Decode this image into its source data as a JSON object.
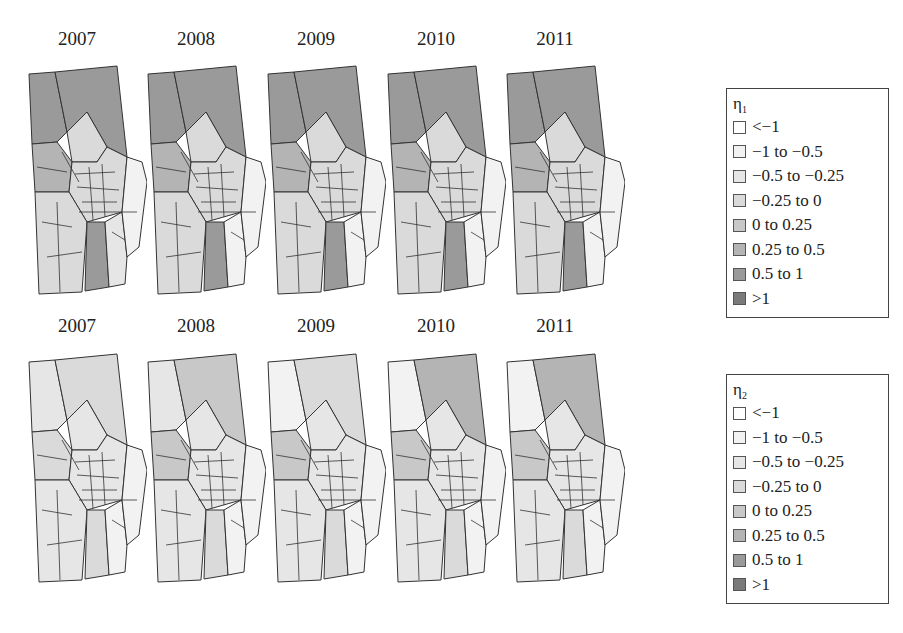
{
  "chart_data": [
    {
      "type": "heatmap",
      "subtype": "choropleth-map-small-multiples",
      "title": "",
      "row_label": "η1",
      "panels": [
        "2007",
        "2008",
        "2009",
        "2010",
        "2011"
      ],
      "legend": {
        "title": "η1",
        "bins": [
          "<−1",
          "−1 to −0.5",
          "−0.5 to −0.25",
          "−0.25 to 0",
          "0 to 0.25",
          "0.25 to 0.5",
          "0.5 to 1",
          ">1"
        ]
      },
      "dominant_pattern": "Northern large districts and southern-central strip shaded 0.5 to 1; central core mixed 0 to 0.5; outer western/southern districts near −0.25 to 0"
    },
    {
      "type": "heatmap",
      "subtype": "choropleth-map-small-multiples",
      "title": "",
      "row_label": "η2",
      "panels": [
        "2007",
        "2008",
        "2009",
        "2010",
        "2011"
      ],
      "legend": {
        "title": "η2",
        "bins": [
          "<−1",
          "−1 to −0.5",
          "−0.5 to −0.25",
          "−0.25 to 0",
          "0 to 0.25",
          "0.25 to 0.5",
          "0.5 to 1",
          ">1"
        ]
      },
      "dominant_pattern": "Mostly light (−0.5 to 0.25); northern district darkens over time reaching 0.25 to 0.5 by 2010–2011; scattered central districts 0.25 to 1"
    }
  ],
  "top_row": {
    "years": [
      "2007",
      "2008",
      "2009",
      "2010",
      "2011"
    ],
    "legend_title_base": "η",
    "legend_title_sub": "1",
    "legend_items": [
      "<−1",
      "−1 to −0.5",
      "−0.5 to −0.25",
      "−0.25 to 0",
      "0 to 0.25",
      "0.25 to 0.5",
      "0.5 to 1",
      ">1"
    ]
  },
  "bottom_row": {
    "years": [
      "2007",
      "2008",
      "2009",
      "2010",
      "2011"
    ],
    "legend_title_base": "η",
    "legend_title_sub": "2",
    "legend_items": [
      "<−1",
      "−1 to −0.5",
      "−0.5 to −0.25",
      "−0.25 to 0",
      "0 to 0.25",
      "0.25 to 0.5",
      "0.5 to 1",
      ">1"
    ]
  },
  "colors": {
    "bins": [
      "#ffffff",
      "#f2f2f2",
      "#e6e6e6",
      "#dadada",
      "#c8c8c8",
      "#b4b4b4",
      "#9a9a9a",
      "#7a7a7a"
    ],
    "outline": "#333333"
  },
  "map_shading": {
    "top": [
      [
        "#9a9a9a",
        "#9a9a9a",
        "#dadada",
        "#b4b4b4",
        "#dadada",
        "#dadada",
        "#9a9a9a",
        "#e6e6e6",
        "#f2f2f2"
      ],
      [
        "#9a9a9a",
        "#9a9a9a",
        "#dadada",
        "#b4b4b4",
        "#dadada",
        "#dadada",
        "#9a9a9a",
        "#f2f2f2",
        "#f2f2f2"
      ],
      [
        "#9a9a9a",
        "#9a9a9a",
        "#dadada",
        "#b4b4b4",
        "#dadada",
        "#dadada",
        "#9a9a9a",
        "#f2f2f2",
        "#f2f2f2"
      ],
      [
        "#9a9a9a",
        "#9a9a9a",
        "#dadada",
        "#b4b4b4",
        "#dadada",
        "#dadada",
        "#9a9a9a",
        "#f2f2f2",
        "#f2f2f2"
      ],
      [
        "#9a9a9a",
        "#9a9a9a",
        "#dadada",
        "#b4b4b4",
        "#dadada",
        "#dadada",
        "#9a9a9a",
        "#f2f2f2",
        "#f2f2f2"
      ]
    ],
    "bottom": [
      [
        "#e6e6e6",
        "#dadada",
        "#e6e6e6",
        "#dadada",
        "#e6e6e6",
        "#e6e6e6",
        "#dadada",
        "#f2f2f2",
        "#f2f2f2"
      ],
      [
        "#e6e6e6",
        "#c8c8c8",
        "#e6e6e6",
        "#c8c8c8",
        "#e6e6e6",
        "#e6e6e6",
        "#dadada",
        "#f2f2f2",
        "#f2f2f2"
      ],
      [
        "#f2f2f2",
        "#dadada",
        "#e6e6e6",
        "#c8c8c8",
        "#e6e6e6",
        "#e6e6e6",
        "#dadada",
        "#f2f2f2",
        "#f2f2f2"
      ],
      [
        "#f2f2f2",
        "#b4b4b4",
        "#e6e6e6",
        "#c8c8c8",
        "#e6e6e6",
        "#e6e6e6",
        "#dadada",
        "#f2f2f2",
        "#f2f2f2"
      ],
      [
        "#f2f2f2",
        "#b4b4b4",
        "#e6e6e6",
        "#c8c8c8",
        "#e6e6e6",
        "#e6e6e6",
        "#dadada",
        "#f2f2f2",
        "#f2f2f2"
      ]
    ]
  }
}
